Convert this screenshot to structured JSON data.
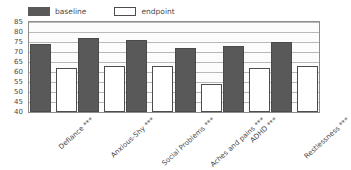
{
  "chart_data": {
    "type": "bar",
    "title": "",
    "subtitle": "",
    "xlabel": "",
    "ylabel": "",
    "ylim": [
      40,
      85
    ],
    "yticks": [
      40,
      45,
      50,
      55,
      60,
      65,
      70,
      75,
      80,
      85
    ],
    "grid": true,
    "legend_position": "top-left",
    "categories": [
      "Defiance ***",
      "Anxious-Shy ***",
      "Social Problems ***",
      "Aches and pains ***",
      "ADHD ***",
      "Restlessness ***"
    ],
    "series": [
      {
        "name": "baseline",
        "color": "#595959",
        "values": [
          74,
          77,
          76,
          72,
          73,
          75
        ]
      },
      {
        "name": "endpoint",
        "color": "#ffffff",
        "values": [
          62,
          63,
          63,
          54,
          62,
          63
        ]
      }
    ]
  },
  "legend": {
    "entries": [
      {
        "label": "baseline",
        "swatch": "filled-dark-square-icon"
      },
      {
        "label": "endpoint",
        "swatch": "empty-white-square-icon"
      }
    ]
  },
  "colors": {
    "baseline_fill": "#595959",
    "endpoint_fill": "#ffffff",
    "bar_outline": "#4a4a4a",
    "gridline": "#b9b9b9",
    "frame_border": "#8d8d8d",
    "plot_background": "#fcfcfc",
    "text": "#4a4a4a"
  }
}
